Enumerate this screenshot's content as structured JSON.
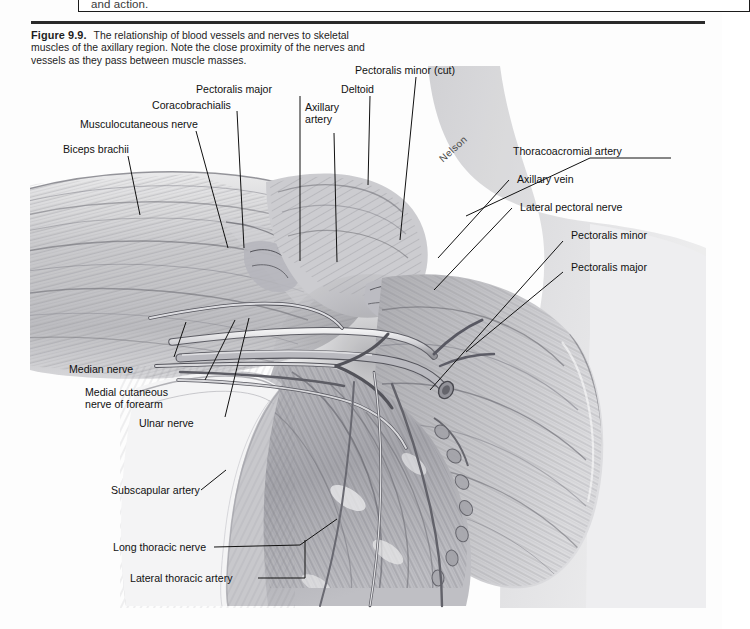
{
  "page": {
    "top_box_text": "and action.",
    "background_color": "#fdfdfd",
    "rule_color": "#2a2a2a"
  },
  "caption": {
    "figure_number": "Figure 9.9.",
    "text": "The relationship of blood vessels and nerves to skeletal muscles of the axillary region. Note the close proximity of the nerves and vessels as they pass between muscle masses."
  },
  "illustration": {
    "artist_signature": "Nelson",
    "subject": "axillary region dissection",
    "style": "graphite pencil rendering, grayscale"
  },
  "labels": {
    "left": [
      {
        "id": "biceps-brachii",
        "text": "Biceps brachii"
      },
      {
        "id": "musculocutaneous-nerve",
        "text": "Musculocutaneous nerve"
      },
      {
        "id": "coracobrachialis",
        "text": "Coracobrachialis"
      },
      {
        "id": "pectoralis-major-top",
        "text": "Pectoralis major"
      },
      {
        "id": "axillary-artery",
        "text": "Axillary\nartery"
      },
      {
        "id": "deltoid",
        "text": "Deltoid"
      },
      {
        "id": "pectoralis-minor-cut",
        "text": "Pectoralis minor (cut)"
      }
    ],
    "right": [
      {
        "id": "thoracoacromial-artery",
        "text": "Thoracoacromial artery"
      },
      {
        "id": "axillary-vein",
        "text": "Axillary vein"
      },
      {
        "id": "lateral-pectoral-nerve",
        "text": "Lateral pectoral nerve"
      },
      {
        "id": "pectoralis-minor",
        "text": "Pectoralis minor"
      },
      {
        "id": "pectoralis-major-right",
        "text": "Pectoralis major"
      }
    ],
    "lower_left": [
      {
        "id": "median-nerve",
        "text": "Median nerve"
      },
      {
        "id": "medial-cutaneous-nerve-of-forearm",
        "text": "Medial cutaneous\nnerve of forearm"
      },
      {
        "id": "ulnar-nerve",
        "text": "Ulnar nerve"
      },
      {
        "id": "subscapular-artery",
        "text": "Subscapular artery"
      },
      {
        "id": "long-thoracic-nerve",
        "text": "Long thoracic nerve"
      },
      {
        "id": "lateral-thoracic-artery",
        "text": "Lateral thoracic artery"
      }
    ]
  }
}
